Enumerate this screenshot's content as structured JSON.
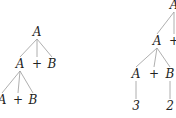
{
  "trees": [
    {
      "name": "left-parse-tree",
      "nodes": [
        {
          "id": "l_root",
          "label": "A",
          "x": 37,
          "y": 36,
          "kind": "var"
        },
        {
          "id": "l_a1",
          "label": "A",
          "x": 20,
          "y": 68,
          "kind": "var"
        },
        {
          "id": "l_p1",
          "label": "+",
          "x": 37,
          "y": 68,
          "kind": "op"
        },
        {
          "id": "l_b1",
          "label": "B",
          "x": 52,
          "y": 68,
          "kind": "var"
        },
        {
          "id": "l_a2",
          "label": "A",
          "x": 2,
          "y": 104,
          "kind": "var"
        },
        {
          "id": "l_p2",
          "label": "+",
          "x": 18,
          "y": 104,
          "kind": "op"
        },
        {
          "id": "l_b2",
          "label": "B",
          "x": 33,
          "y": 104,
          "kind": "var"
        }
      ],
      "edges": [
        [
          "l_root",
          "l_a1"
        ],
        [
          "l_root",
          "l_p1"
        ],
        [
          "l_root",
          "l_b1"
        ],
        [
          "l_a1",
          "l_a2"
        ],
        [
          "l_a1",
          "l_p2"
        ],
        [
          "l_a1",
          "l_b2"
        ]
      ]
    },
    {
      "name": "right-parse-tree",
      "nodes": [
        {
          "id": "r_root",
          "label": "A",
          "x": 174,
          "y": 9,
          "kind": "var"
        },
        {
          "id": "r_a1",
          "label": "A",
          "x": 157,
          "y": 45,
          "kind": "var"
        },
        {
          "id": "r_p1",
          "label": "+",
          "x": 174,
          "y": 45,
          "kind": "op"
        },
        {
          "id": "r_a2",
          "label": "A",
          "x": 136,
          "y": 78,
          "kind": "var"
        },
        {
          "id": "r_p2",
          "label": "+",
          "x": 154,
          "y": 78,
          "kind": "op"
        },
        {
          "id": "r_b2",
          "label": "B",
          "x": 170,
          "y": 78,
          "kind": "var"
        },
        {
          "id": "r_n3",
          "label": "3",
          "x": 136,
          "y": 110,
          "kind": "var"
        },
        {
          "id": "r_n2",
          "label": "2",
          "x": 170,
          "y": 110,
          "kind": "var"
        }
      ],
      "edges": [
        [
          "r_root",
          "r_a1"
        ],
        [
          "r_root",
          "r_p1"
        ],
        [
          "r_a1",
          "r_a2"
        ],
        [
          "r_a1",
          "r_p2"
        ],
        [
          "r_a1",
          "r_b2"
        ],
        [
          "r_a2",
          "r_n3"
        ],
        [
          "r_b2",
          "r_n2"
        ]
      ]
    }
  ]
}
